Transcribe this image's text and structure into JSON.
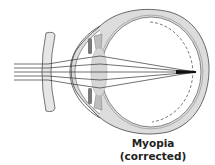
{
  "diagram": {
    "title": "Myopia",
    "subtitle": "(corrected)",
    "colors": {
      "outline": "#3a3a3a",
      "sclera_fill": "#d9d9d9",
      "lens_fill": "#d6d6d6",
      "glasses_fill": "#e6e6e6",
      "ray": "#333333"
    },
    "parts": [
      "corrective-lens",
      "cornea",
      "iris",
      "crystalline-lens",
      "sclera",
      "retina",
      "light-rays",
      "focal-point"
    ]
  }
}
